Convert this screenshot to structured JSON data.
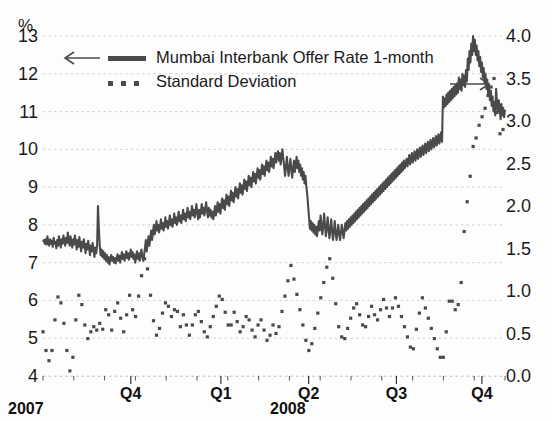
{
  "chart_data": {
    "type": "line",
    "title": "",
    "unit_label": "%",
    "xlabel": "",
    "ylabel": "%",
    "grid": true,
    "legend_position": "top-left",
    "x_axis": {
      "quarter_ticks": [
        {
          "label": "Q4",
          "pos": 0.19
        },
        {
          "label": "Q1",
          "pos": 0.385
        },
        {
          "label": "Q2",
          "pos": 0.575
        },
        {
          "label": "Q3",
          "pos": 0.765
        },
        {
          "label": "Q4",
          "pos": 0.95
        }
      ],
      "year_labels": [
        "2007",
        "2008"
      ]
    },
    "y_left": {
      "label": "%",
      "ticks": [
        "13",
        "12",
        "11",
        "10",
        "9",
        "8",
        "7",
        "6",
        "5",
        "4"
      ],
      "min": 4,
      "max": 13,
      "arrow": "left"
    },
    "y_right": {
      "ticks": [
        "4.0",
        "3.5",
        "3.0",
        "2.5",
        "2.0",
        "1.5",
        "1.0",
        "0.5",
        "0.0"
      ],
      "min": 0.0,
      "max": 4.0,
      "arrow": "right"
    },
    "series": [
      {
        "name": "Mumbai Interbank Offer Rate 1-month",
        "axis": "left",
        "style": "solid-line",
        "color": "#4a4a4a",
        "values": [
          7.55,
          7.6,
          7.5,
          7.62,
          7.48,
          7.7,
          7.52,
          7.45,
          7.62,
          7.5,
          7.58,
          7.42,
          7.66,
          7.5,
          7.55,
          7.38,
          7.6,
          7.45,
          7.7,
          7.55,
          7.4,
          7.62,
          7.5,
          7.72,
          7.58,
          7.45,
          7.66,
          7.52,
          7.8,
          7.6,
          7.45,
          7.7,
          7.55,
          7.4,
          7.62,
          7.48,
          7.72,
          7.55,
          7.35,
          7.6,
          7.42,
          7.68,
          7.5,
          7.3,
          7.55,
          7.4,
          7.62,
          7.45,
          7.25,
          7.5,
          7.35,
          7.58,
          7.4,
          7.2,
          7.45,
          7.3,
          7.52,
          7.35,
          7.15,
          7.4,
          7.25,
          7.45,
          8.5,
          7.9,
          7.45,
          7.2,
          7.35,
          7.15,
          7.3,
          7.1,
          7.25,
          7.05,
          7.2,
          7.0,
          7.15,
          6.95,
          7.1,
          7.2,
          7.05,
          7.15,
          7.0,
          7.12,
          6.98,
          7.1,
          7.22,
          7.05,
          7.18,
          7.0,
          7.15,
          7.28,
          7.1,
          7.22,
          7.05,
          7.18,
          7.3,
          7.12,
          7.25,
          7.08,
          7.2,
          7.35,
          7.15,
          7.28,
          7.1,
          7.22,
          7.0,
          7.15,
          7.3,
          7.1,
          7.25,
          7.05,
          7.2,
          7.35,
          7.15,
          7.05,
          7.2,
          7.4,
          7.6,
          7.3,
          7.5,
          7.7,
          7.45,
          7.65,
          7.85,
          7.6,
          7.8,
          8.0,
          7.75,
          7.9,
          8.1,
          7.85,
          8.0,
          7.8,
          7.95,
          8.15,
          7.9,
          8.05,
          7.85,
          8.0,
          8.2,
          7.95,
          8.1,
          7.9,
          8.05,
          8.25,
          8.0,
          8.15,
          7.95,
          8.1,
          8.3,
          8.05,
          8.2,
          8.0,
          8.15,
          8.35,
          8.1,
          8.25,
          8.05,
          8.2,
          8.4,
          8.15,
          8.3,
          8.1,
          8.25,
          8.45,
          8.2,
          8.35,
          8.15,
          8.3,
          8.5,
          8.25,
          8.4,
          8.2,
          8.35,
          8.55,
          8.3,
          8.15,
          8.4,
          8.2,
          8.35,
          8.55,
          8.3,
          8.45,
          8.25,
          8.4,
          8.6,
          8.35,
          8.2,
          8.45,
          8.25,
          8.4,
          8.2,
          8.35,
          8.15,
          8.3,
          8.5,
          8.25,
          8.4,
          8.6,
          8.35,
          8.55,
          8.3,
          8.5,
          8.7,
          8.45,
          8.65,
          8.4,
          8.6,
          8.8,
          8.55,
          8.75,
          8.5,
          8.7,
          8.9,
          8.65,
          8.85,
          8.6,
          8.8,
          9.0,
          8.75,
          8.95,
          8.7,
          8.9,
          9.1,
          8.85,
          9.05,
          8.8,
          9.0,
          9.2,
          8.95,
          9.15,
          8.9,
          9.1,
          9.3,
          9.05,
          9.25,
          9.0,
          9.2,
          9.4,
          9.15,
          9.35,
          9.1,
          9.3,
          9.5,
          9.25,
          9.45,
          9.2,
          9.4,
          9.6,
          9.35,
          9.55,
          9.3,
          9.5,
          9.7,
          9.45,
          9.65,
          9.4,
          9.6,
          9.8,
          9.55,
          9.75,
          9.5,
          9.7,
          9.9,
          9.65,
          9.85,
          9.95,
          9.7,
          9.9,
          9.6,
          9.8,
          10.0,
          9.75,
          9.55,
          9.3,
          9.55,
          9.8,
          9.5,
          9.3,
          9.55,
          9.75,
          9.45,
          9.25,
          9.5,
          9.7,
          9.4,
          9.6,
          9.8,
          9.5,
          9.7,
          9.4,
          9.6,
          9.3,
          9.5,
          9.2,
          9.4,
          9.1,
          9.3,
          9.0,
          8.8,
          8.5,
          8.2,
          7.9,
          8.1,
          7.85,
          8.05,
          7.8,
          8.0,
          7.75,
          7.95,
          7.7,
          7.9,
          8.1,
          7.85,
          8.25,
          8.0,
          7.75,
          7.95,
          8.3,
          8.0,
          7.7,
          7.9,
          8.2,
          7.9,
          7.65,
          7.85,
          8.15,
          7.85,
          7.6,
          7.8,
          8.1,
          7.8,
          7.6,
          7.8,
          8.0,
          7.75,
          7.6,
          7.8,
          8.0,
          7.8,
          7.65,
          7.85,
          8.05,
          7.85,
          8.1,
          7.9,
          8.15,
          7.95,
          8.2,
          8.0,
          8.25,
          8.05,
          8.3,
          8.1,
          8.35,
          8.15,
          8.4,
          8.2,
          8.45,
          8.25,
          8.5,
          8.3,
          8.55,
          8.35,
          8.6,
          8.4,
          8.65,
          8.45,
          8.7,
          8.5,
          8.75,
          8.55,
          8.8,
          8.6,
          8.85,
          8.65,
          8.9,
          8.7,
          8.95,
          8.75,
          9.0,
          8.8,
          9.05,
          8.85,
          9.1,
          8.9,
          9.15,
          8.95,
          9.2,
          9.0,
          9.25,
          9.05,
          9.3,
          9.1,
          9.35,
          9.15,
          9.4,
          9.2,
          9.45,
          9.25,
          9.5,
          9.3,
          9.55,
          9.35,
          9.6,
          9.4,
          9.65,
          9.45,
          9.7,
          9.5,
          9.6,
          9.75,
          9.55,
          9.7,
          9.85,
          9.6,
          9.75,
          9.9,
          9.65,
          9.8,
          9.95,
          9.7,
          9.85,
          10.0,
          9.75,
          9.9,
          10.05,
          9.8,
          9.95,
          10.1,
          9.85,
          10.0,
          10.15,
          9.9,
          10.05,
          10.2,
          9.95,
          10.1,
          10.25,
          10.0,
          10.15,
          10.3,
          10.05,
          10.2,
          10.35,
          10.1,
          10.25,
          10.4,
          10.15,
          10.3,
          10.45,
          10.2,
          11.4,
          11.1,
          11.35,
          11.15,
          11.45,
          11.2,
          11.5,
          11.25,
          11.55,
          11.3,
          11.6,
          11.35,
          11.65,
          11.4,
          11.7,
          11.45,
          11.75,
          11.5,
          11.9,
          11.6,
          11.85,
          11.55,
          12.0,
          11.7,
          11.95,
          11.65,
          12.1,
          11.8,
          12.4,
          12.1,
          12.6,
          12.3,
          12.8,
          12.5,
          13.0,
          12.6,
          12.9,
          12.5,
          12.75,
          12.35,
          12.6,
          12.2,
          12.45,
          12.05,
          12.3,
          11.9,
          12.15,
          11.75,
          12.0,
          11.6,
          11.85,
          11.45,
          11.7,
          11.3,
          11.55,
          11.15,
          11.4,
          11.0,
          11.25,
          10.9,
          11.6,
          11.2,
          11.0,
          11.3,
          11.1,
          10.8,
          11.2,
          10.9,
          11.1,
          10.85,
          11.05
        ]
      },
      {
        "name": "Standard Deviation",
        "axis": "right",
        "style": "dotted",
        "color": "#4a4a4a",
        "values": [
          0.52,
          0.38,
          0.45,
          0.3,
          0.22,
          0.28,
          0.18,
          0.12,
          0.2,
          0.3,
          0.42,
          0.55,
          0.66,
          0.78,
          0.86,
          0.93,
          0.98,
          0.92,
          0.86,
          0.8,
          0.72,
          0.62,
          0.5,
          0.4,
          0.3,
          0.2,
          0.12,
          0.06,
          0.04,
          0.1,
          0.22,
          0.38,
          0.52,
          0.66,
          0.78,
          0.88,
          0.95,
          0.98,
          0.92,
          0.84,
          0.76,
          0.68,
          0.6,
          0.54,
          0.48,
          0.44,
          0.42,
          0.46,
          0.52,
          0.58,
          0.62,
          0.58,
          0.52,
          0.48,
          0.54,
          0.6,
          0.66,
          0.62,
          0.56,
          0.5,
          0.55,
          0.62,
          0.7,
          0.78,
          0.85,
          0.8,
          0.72,
          0.66,
          0.6,
          0.54,
          0.6,
          0.68,
          0.76,
          0.84,
          0.9,
          0.86,
          0.8,
          0.74,
          0.68,
          0.62,
          0.56,
          0.52,
          0.58,
          0.65,
          0.72,
          0.8,
          0.88,
          0.95,
          0.9,
          0.84,
          0.78,
          0.72,
          0.66,
          0.7,
          0.78,
          0.86,
          0.94,
          1.02,
          1.1,
          1.18,
          1.25,
          1.32,
          1.38,
          1.42,
          1.35,
          1.26,
          1.16,
          1.05,
          0.95,
          0.85,
          0.75,
          0.65,
          0.58,
          0.52,
          0.48,
          0.46,
          0.5,
          0.56,
          0.62,
          0.68,
          0.74,
          0.78,
          0.82,
          0.86,
          0.9,
          0.86,
          0.82,
          0.78,
          0.74,
          0.7,
          0.66,
          0.72,
          0.78,
          0.84,
          0.8,
          0.76,
          0.7,
          0.64,
          0.58,
          0.6,
          0.66,
          0.72,
          0.7,
          0.65,
          0.6,
          0.55,
          0.5,
          0.48,
          0.52,
          0.56,
          0.6,
          0.64,
          0.68,
          0.72,
          0.76,
          0.8,
          0.76,
          0.72,
          0.68,
          0.64,
          0.6,
          0.56,
          0.52,
          0.48,
          0.44,
          0.46,
          0.5,
          0.54,
          0.58,
          0.62,
          0.66,
          0.7,
          0.74,
          0.78,
          0.82,
          0.86,
          0.9,
          0.94,
          0.98,
          0.95,
          0.9,
          0.85,
          0.8,
          0.75,
          0.7,
          0.65,
          0.6,
          0.58,
          0.56,
          0.6,
          0.65,
          0.7,
          0.75,
          0.72,
          0.68,
          0.64,
          0.6,
          0.56,
          0.52,
          0.5,
          0.54,
          0.58,
          0.62,
          0.66,
          0.7,
          0.74,
          0.7,
          0.66,
          0.62,
          0.58,
          0.54,
          0.5,
          0.48,
          0.46,
          0.5,
          0.55,
          0.6,
          0.65,
          0.7,
          0.66,
          0.62,
          0.58,
          0.54,
          0.5,
          0.46,
          0.42,
          0.4,
          0.44,
          0.48,
          0.52,
          0.56,
          0.6,
          0.58,
          0.54,
          0.5,
          0.48,
          0.52,
          0.58,
          0.64,
          0.7,
          0.76,
          0.82,
          0.88,
          0.94,
          1.0,
          1.06,
          1.12,
          1.18,
          1.24,
          1.3,
          1.26,
          1.2,
          1.14,
          1.08,
          1.02,
          0.96,
          0.9,
          0.84,
          0.78,
          0.72,
          0.66,
          0.6,
          0.54,
          0.48,
          0.42,
          0.38,
          0.34,
          0.3,
          0.28,
          0.32,
          0.38,
          0.44,
          0.5,
          0.56,
          0.62,
          0.68,
          0.74,
          0.8,
          0.86,
          0.92,
          0.98,
          1.04,
          1.1,
          1.16,
          1.22,
          1.28,
          1.34,
          1.4,
          1.38,
          1.32,
          1.24,
          1.15,
          1.05,
          0.95,
          0.85,
          0.75,
          0.66,
          0.58,
          0.52,
          0.48,
          0.46,
          0.44,
          0.42,
          0.44,
          0.48,
          0.52,
          0.56,
          0.6,
          0.64,
          0.68,
          0.72,
          0.76,
          0.8,
          0.84,
          0.88,
          0.85,
          0.8,
          0.76,
          0.72,
          0.68,
          0.64,
          0.6,
          0.58,
          0.56,
          0.58,
          0.62,
          0.66,
          0.7,
          0.74,
          0.78,
          0.82,
          0.8,
          0.76,
          0.72,
          0.7,
          0.68,
          0.66,
          0.7,
          0.74,
          0.78,
          0.82,
          0.86,
          0.9,
          0.88,
          0.84,
          0.8,
          0.76,
          0.72,
          0.7,
          0.72,
          0.76,
          0.8,
          0.84,
          0.88,
          0.92,
          0.9,
          0.86,
          0.82,
          0.78,
          0.74,
          0.7,
          0.66,
          0.62,
          0.58,
          0.54,
          0.5,
          0.46,
          0.42,
          0.38,
          0.34,
          0.3,
          0.28,
          0.32,
          0.38,
          0.46,
          0.55,
          0.62,
          0.68,
          0.74,
          0.8,
          0.86,
          0.92,
          0.88,
          0.84,
          0.8,
          0.76,
          0.72,
          0.68,
          0.64,
          0.6,
          0.56,
          0.52,
          0.48,
          0.44,
          0.4,
          0.36,
          0.32,
          0.28,
          0.24,
          0.22,
          0.2,
          0.18,
          0.22,
          0.3,
          0.4,
          0.52,
          0.64,
          0.76,
          0.88,
          0.95,
          0.92,
          0.88,
          0.84,
          0.8,
          0.78,
          0.76,
          0.8,
          0.84,
          0.88,
          0.92,
          1.1,
          1.3,
          1.5,
          1.7,
          1.85,
          1.95,
          2.05,
          2.15,
          2.25,
          2.35,
          2.45,
          2.55,
          2.7,
          2.85,
          2.7,
          2.8,
          2.6,
          2.75,
          2.95,
          3.1,
          2.9,
          3.05,
          3.2,
          3.0,
          3.15,
          3.35,
          3.5,
          3.3,
          3.45,
          3.6,
          3.4,
          3.55,
          3.7,
          3.5,
          3.4,
          3.25,
          3.1,
          2.95,
          3.05,
          2.85,
          2.95,
          2.75,
          2.9,
          2.7,
          2.85
        ]
      }
    ]
  },
  "legend": {
    "series1_label": "Mumbai Interbank Offer Rate 1-month",
    "series2_label": "Standard Deviation",
    "left_arrow_name": "left-arrow-icon",
    "right_arrow_name": "right-arrow-icon"
  }
}
